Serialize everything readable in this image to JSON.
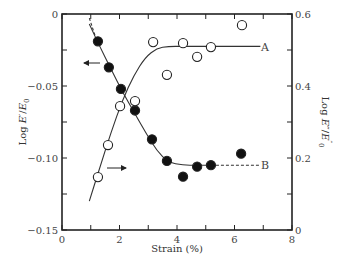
{
  "chart_data": {
    "type": "scatter",
    "title": "",
    "xlabel": "Strain (%)",
    "ylabel_left": "Log E'/E'0",
    "ylabel_right": "Log E''/E''0",
    "xlim": [
      0,
      8
    ],
    "ylim_left": [
      -0.15,
      0
    ],
    "ylim_right": [
      0,
      0.6
    ],
    "grid": false,
    "x_ticks": [
      "0",
      "2",
      "4",
      "6",
      "8"
    ],
    "y_ticks_left": [
      "0",
      "−0.05",
      "−0.10",
      "−0.15"
    ],
    "y_ticks_right": [
      "0.6",
      "0.4",
      "0.2",
      "0"
    ],
    "series": [
      {
        "name": "B",
        "marker": "filled-circle",
        "axis": "left",
        "x": [
          1.25,
          1.63,
          2.05,
          2.54,
          3.13,
          3.65,
          4.21,
          4.7,
          5.18,
          6.23
        ],
        "y": [
          -0.019,
          -0.037,
          -0.052,
          -0.067,
          -0.087,
          -0.102,
          -0.113,
          -0.106,
          -0.105,
          -0.097
        ]
      },
      {
        "name": "A",
        "marker": "open-circle",
        "axis": "right",
        "x": [
          1.25,
          1.6,
          2.02,
          2.54,
          3.17,
          3.65,
          4.21,
          4.7,
          5.18,
          6.26
        ],
        "y": [
          0.147,
          0.236,
          0.344,
          0.358,
          0.522,
          0.431,
          0.519,
          0.481,
          0.508,
          0.569
        ]
      }
    ],
    "fit_curves": [
      {
        "name": "A",
        "axis": "right",
        "x": [
          0.95,
          1.3,
          1.7,
          2.1,
          2.5,
          2.9,
          3.3,
          3.7,
          4.2,
          5.0,
          6.0,
          6.9
        ],
        "y": [
          0.08,
          0.17,
          0.27,
          0.36,
          0.43,
          0.48,
          0.505,
          0.51,
          0.51,
          0.51,
          0.51,
          0.51
        ]
      },
      {
        "name": "B",
        "axis": "left",
        "x": [
          0.95,
          1.3,
          1.7,
          2.1,
          2.5,
          2.9,
          3.3,
          3.7,
          4.2,
          4.7,
          5.18
        ],
        "y": [
          -0.007,
          -0.022,
          -0.038,
          -0.054,
          -0.068,
          -0.082,
          -0.095,
          -0.103,
          -0.105,
          -0.105,
          -0.105
        ],
        "dashed_head": {
          "x": [
            0.95,
            1.15
          ],
          "y": [
            -0.007,
            -0.015
          ]
        },
        "dashed_tail": {
          "x": [
            5.18,
            6.9
          ],
          "y": [
            -0.105,
            -0.105
          ]
        }
      }
    ],
    "annotations": [
      {
        "text": "A",
        "x": 7.1,
        "y_right": 0.51
      },
      {
        "text": "B",
        "x": 7.1,
        "y_left": -0.105
      },
      {
        "text": "←",
        "meaning": "series B uses left axis",
        "x": 1.2,
        "y_left": -0.036
      },
      {
        "text": "→",
        "meaning": "series A uses right axis",
        "x": 2.5,
        "y_left": -0.12
      }
    ]
  },
  "labels": {
    "xlabel": "Strain (%)",
    "curve_a": "A",
    "curve_b": "B"
  }
}
